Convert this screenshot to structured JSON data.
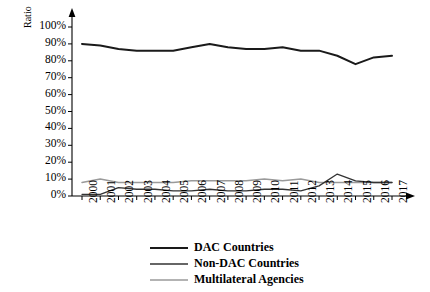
{
  "chart_data": {
    "type": "line",
    "title": "",
    "xlabel": "",
    "ylabel": "Ratio",
    "x": [
      2000,
      2001,
      2002,
      2003,
      2004,
      2005,
      2006,
      2007,
      2008,
      2009,
      2010,
      2011,
      2012,
      2013,
      2014,
      2015,
      2016,
      2017
    ],
    "xtick_labels": [
      "2000",
      "2001",
      "2002",
      "2003",
      "2004",
      "2005",
      "2006",
      "2007",
      "2008",
      "2009",
      "2010",
      "2011",
      "2012",
      "2013",
      "2014",
      "2015",
      "2016",
      "2017"
    ],
    "ytick_labels": [
      "0%",
      "10%",
      "20%",
      "30%",
      "40%",
      "50%",
      "60%",
      "70%",
      "80%",
      "90%",
      "100%"
    ],
    "ytick_values": [
      0,
      10,
      20,
      30,
      40,
      50,
      60,
      70,
      80,
      90,
      100
    ],
    "ylim": [
      0,
      100
    ],
    "grid": false,
    "legend_position": "bottom",
    "series": [
      {
        "name": "DAC Countries",
        "color": "#1a1a1a",
        "width": 2.0,
        "values": [
          90,
          89,
          87,
          86,
          86,
          86,
          88,
          90,
          88,
          87,
          87,
          88,
          86,
          86,
          83,
          78,
          82,
          83
        ]
      },
      {
        "name": "Non-DAC Countries",
        "color": "#333333",
        "width": 1.3,
        "values": [
          1,
          1,
          5,
          4,
          4,
          3,
          3,
          4,
          3,
          3,
          4,
          4,
          3,
          6,
          13,
          9,
          8,
          8
        ]
      },
      {
        "name": "Multilateral Agencies",
        "color": "#9a9a9a",
        "width": 1.5,
        "values": [
          8,
          10,
          8,
          8,
          8,
          8,
          9,
          9,
          9,
          9,
          10,
          9,
          10,
          8,
          8,
          8,
          8,
          8
        ]
      }
    ]
  },
  "legend": {
    "items": [
      {
        "label": "DAC Countries"
      },
      {
        "label": "Non-DAC Countries"
      },
      {
        "label": "Multilateral Agencies"
      }
    ]
  }
}
